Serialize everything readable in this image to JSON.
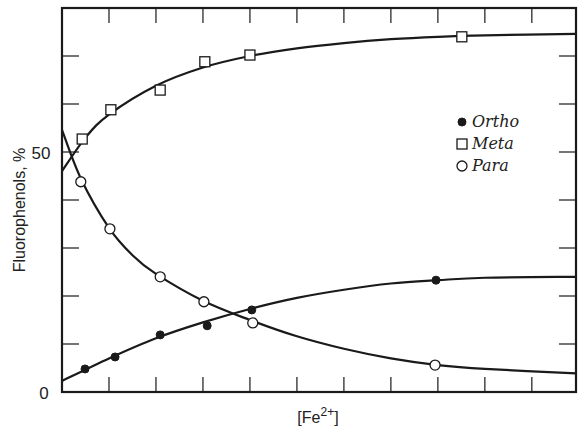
{
  "chart_data": {
    "type": "scatter",
    "title": "",
    "xlabel": "[Fe2+]",
    "xlabel_parts": {
      "base": "[Fe",
      "sup": "2+",
      "close": "]"
    },
    "ylabel": "Fluorophenols, %",
    "xlim": [
      0,
      10.94
    ],
    "ylim": [
      0,
      80
    ],
    "x_ticks_count": 10,
    "y_ticks": [
      0,
      10,
      20,
      30,
      40,
      50,
      60,
      70
    ],
    "y_tick_labels": [
      {
        "value": 0,
        "label": "0"
      },
      {
        "value": 50,
        "label": "50"
      }
    ],
    "grid": false,
    "legend_position": "right-center",
    "series": [
      {
        "name": "Ortho",
        "marker": "filled-circle",
        "points": [
          [
            0.49,
            4.8
          ],
          [
            1.13,
            7.3
          ],
          [
            2.09,
            11.9
          ],
          [
            3.09,
            13.8
          ],
          [
            4.04,
            17.1
          ],
          [
            7.96,
            23.3
          ]
        ],
        "curve": [
          [
            0,
            2.3
          ],
          [
            1,
            7.0
          ],
          [
            2,
            11.2
          ],
          [
            3,
            14.5
          ],
          [
            4,
            17.3
          ],
          [
            5,
            19.6
          ],
          [
            6,
            21.3
          ],
          [
            7,
            22.6
          ],
          [
            8,
            23.3
          ],
          [
            9,
            23.8
          ],
          [
            10.94,
            24.0
          ]
        ]
      },
      {
        "name": "Meta",
        "marker": "open-square",
        "points": [
          [
            0.43,
            52.7
          ],
          [
            1.04,
            58.8
          ],
          [
            2.09,
            62.9
          ],
          [
            3.04,
            68.8
          ],
          [
            4.0,
            70.2
          ],
          [
            8.51,
            74.0
          ]
        ],
        "curve": [
          [
            0,
            46.0
          ],
          [
            0.5,
            53.0
          ],
          [
            1,
            57.8
          ],
          [
            2,
            63.8
          ],
          [
            3,
            67.6
          ],
          [
            4,
            70.0
          ],
          [
            5,
            71.6
          ],
          [
            6,
            72.7
          ],
          [
            7,
            73.5
          ],
          [
            8,
            74.0
          ],
          [
            9,
            74.3
          ],
          [
            10.94,
            74.6
          ]
        ]
      },
      {
        "name": "Para",
        "marker": "open-circle",
        "points": [
          [
            0.4,
            43.8
          ],
          [
            1.02,
            34.0
          ],
          [
            2.09,
            24.0
          ],
          [
            3.02,
            18.8
          ],
          [
            4.06,
            14.4
          ],
          [
            7.94,
            5.6
          ]
        ],
        "curve": [
          [
            0,
            54.6
          ],
          [
            0.4,
            44.5
          ],
          [
            1,
            34.2
          ],
          [
            1.5,
            28.5
          ],
          [
            2,
            24.6
          ],
          [
            3,
            19.0
          ],
          [
            4,
            15.0
          ],
          [
            5,
            11.6
          ],
          [
            6,
            9.0
          ],
          [
            7,
            7.0
          ],
          [
            8,
            5.6
          ],
          [
            9,
            4.8
          ],
          [
            10.94,
            3.9
          ]
        ]
      }
    ]
  },
  "legend": {
    "items": [
      {
        "label": "Ortho",
        "marker": "filled-circle"
      },
      {
        "label": "Meta",
        "marker": "open-square"
      },
      {
        "label": "Para",
        "marker": "open-circle"
      }
    ]
  }
}
